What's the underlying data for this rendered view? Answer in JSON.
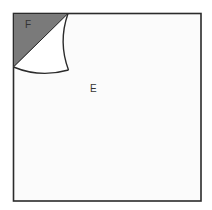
{
  "diagram": {
    "labels": {
      "shaded_region": "F",
      "square_region": "E"
    },
    "colors": {
      "shade": "#7a7a7a",
      "stroke": "#2b2b2b",
      "background": "#ffffff",
      "square_fill": "#fbfbfb"
    }
  }
}
